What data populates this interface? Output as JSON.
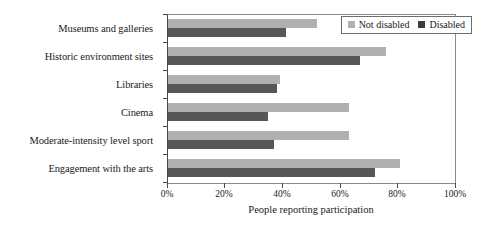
{
  "chart_data": {
    "type": "bar",
    "orientation": "horizontal",
    "title": "",
    "xlabel": "People reporting participation",
    "ylabel": "",
    "xlim": [
      0,
      100
    ],
    "xticks": [
      "0%",
      "20%",
      "40%",
      "60%",
      "80%",
      "100%"
    ],
    "xtick_values": [
      0,
      20,
      40,
      60,
      80,
      100
    ],
    "grid": false,
    "legend_position": "top-right",
    "categories": [
      "Museums and galleries",
      "Historic environment sites",
      "Libraries",
      "Cinema",
      "Moderate-intensity level sport",
      "Engagement with the arts"
    ],
    "series": [
      {
        "name": "Not disabled",
        "color": "#b0b0b0",
        "values": [
          52,
          76,
          39,
          63,
          63,
          81
        ]
      },
      {
        "name": "Disabled",
        "color": "#575757",
        "values": [
          41,
          67,
          38,
          35,
          37,
          72
        ]
      }
    ]
  },
  "legend": {
    "items": [
      {
        "label": "Not disabled"
      },
      {
        "label": "Disabled"
      }
    ]
  }
}
